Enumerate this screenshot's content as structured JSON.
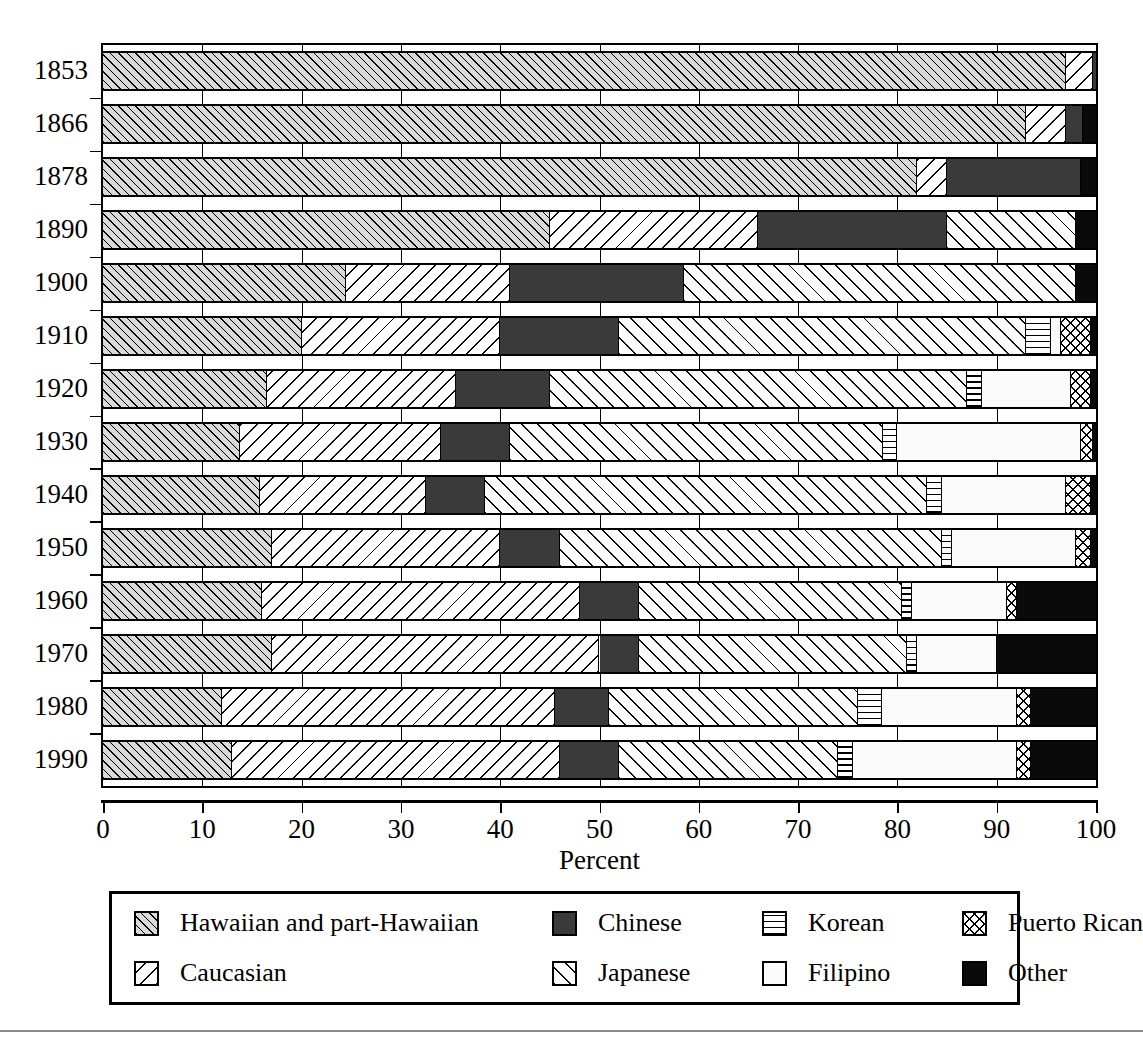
{
  "chart_data": {
    "type": "bar",
    "orientation": "horizontal",
    "stacked": true,
    "normalized": true,
    "title": "",
    "xlabel": "Percent",
    "ylabel": "",
    "xlim": [
      0,
      100
    ],
    "xticks": [
      0,
      10,
      20,
      30,
      40,
      50,
      60,
      70,
      80,
      90,
      100
    ],
    "grid": "vertical",
    "legend_position": "bottom",
    "categories": [
      "1853",
      "1866",
      "1878",
      "1890",
      "1900",
      "1910",
      "1920",
      "1930",
      "1940",
      "1950",
      "1960",
      "1970",
      "1980",
      "1990"
    ],
    "series": [
      {
        "name": "Hawaiian and part-Hawaiian",
        "pattern": "diagonal-hatch-gray",
        "values": [
          97.0,
          93.0,
          82.0,
          45.0,
          24.5,
          20.0,
          16.5,
          13.8,
          15.8,
          17.0,
          16.0,
          17.0,
          12.0,
          13.0
        ]
      },
      {
        "name": "Caucasian",
        "pattern": "backslash-hatch-white",
        "values": [
          2.7,
          4.0,
          3.0,
          21.0,
          16.5,
          20.0,
          19.0,
          20.2,
          16.7,
          23.0,
          32.0,
          33.0,
          33.5,
          33.0
        ]
      },
      {
        "name": "Chinese",
        "pattern": "solid-dark-gray",
        "values": [
          0.3,
          1.7,
          13.5,
          19.0,
          17.5,
          12.0,
          9.5,
          7.0,
          6.0,
          6.0,
          6.0,
          4.0,
          5.5,
          6.0
        ]
      },
      {
        "name": "Japanese",
        "pattern": "slash-hatch-white",
        "values": [
          0.0,
          0.0,
          0.0,
          13.0,
          39.5,
          41.0,
          42.0,
          37.5,
          44.5,
          38.5,
          26.5,
          27.0,
          25.0,
          22.0
        ]
      },
      {
        "name": "Korean",
        "pattern": "horizontal-lines",
        "values": [
          0.0,
          0.0,
          0.0,
          0.0,
          0.0,
          2.5,
          1.5,
          1.5,
          1.5,
          1.0,
          1.0,
          1.0,
          2.5,
          1.5
        ]
      },
      {
        "name": "Filipino",
        "pattern": "blank-white",
        "values": [
          0.0,
          0.0,
          0.0,
          0.0,
          0.0,
          1.0,
          9.0,
          18.5,
          12.5,
          12.5,
          9.5,
          8.0,
          13.5,
          16.5
        ]
      },
      {
        "name": "Puerto Rican",
        "pattern": "crosshatch",
        "values": [
          0.0,
          0.0,
          0.0,
          0.0,
          0.0,
          3.0,
          2.0,
          1.2,
          2.5,
          1.5,
          1.0,
          0.0,
          1.5,
          1.5
        ]
      },
      {
        "name": "Other",
        "pattern": "solid-black",
        "values": [
          0.0,
          1.3,
          1.5,
          2.0,
          2.0,
          0.5,
          0.5,
          0.3,
          0.5,
          0.5,
          8.0,
          10.0,
          6.5,
          6.5
        ]
      }
    ]
  },
  "axis": {
    "x_title": "Percent",
    "x_tick_labels": [
      "0",
      "10",
      "20",
      "30",
      "40",
      "50",
      "60",
      "70",
      "80",
      "90",
      "100"
    ],
    "y_tick_labels": [
      "1853",
      "1866",
      "1878",
      "1890",
      "1900",
      "1910",
      "1920",
      "1930",
      "1940",
      "1950",
      "1960",
      "1970",
      "1980",
      "1990"
    ]
  },
  "legend": {
    "entries": [
      {
        "label": "Hawaiian and part-Hawaiian",
        "pattern": "p-hawaiian"
      },
      {
        "label": "Chinese",
        "pattern": "p-chinese"
      },
      {
        "label": "Korean",
        "pattern": "p-korean"
      },
      {
        "label": "Puerto Rican",
        "pattern": "p-puertorican"
      },
      {
        "label": "Caucasian",
        "pattern": "p-caucasian"
      },
      {
        "label": "Japanese",
        "pattern": "p-japanese"
      },
      {
        "label": "Filipino",
        "pattern": "p-filipino"
      },
      {
        "label": "Other",
        "pattern": "p-other"
      }
    ]
  },
  "colors": {
    "ink": "#000000",
    "background": "#ffffff",
    "hawaiian_fill": "#d9d9d9",
    "chinese_fill": "#3a3a3a",
    "other_fill": "#0a0a0a"
  }
}
